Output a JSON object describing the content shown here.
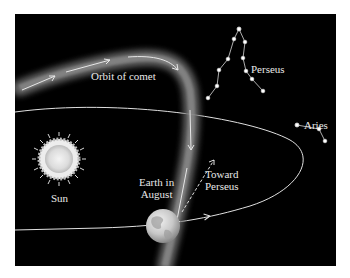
{
  "diagram": {
    "labels": {
      "orbit_of_comet": "Orbit of comet",
      "perseus": "Perseus",
      "aries": "Aries",
      "sun": "Sun",
      "earth_line1": "Earth in",
      "earth_line2": "August",
      "toward_line1": "Toward",
      "toward_line2": "Perseus"
    },
    "colors": {
      "background": "#000000",
      "frame": "#ffffff",
      "text": "#e8e8e8",
      "orbit_line": "#e0e0e0",
      "comet_band": "#7a7a7a"
    },
    "objects": [
      "Sun",
      "Earth",
      "Earth orbit",
      "Comet orbit",
      "Perseus constellation",
      "Aries constellation",
      "Direction arrow toward Perseus"
    ]
  }
}
